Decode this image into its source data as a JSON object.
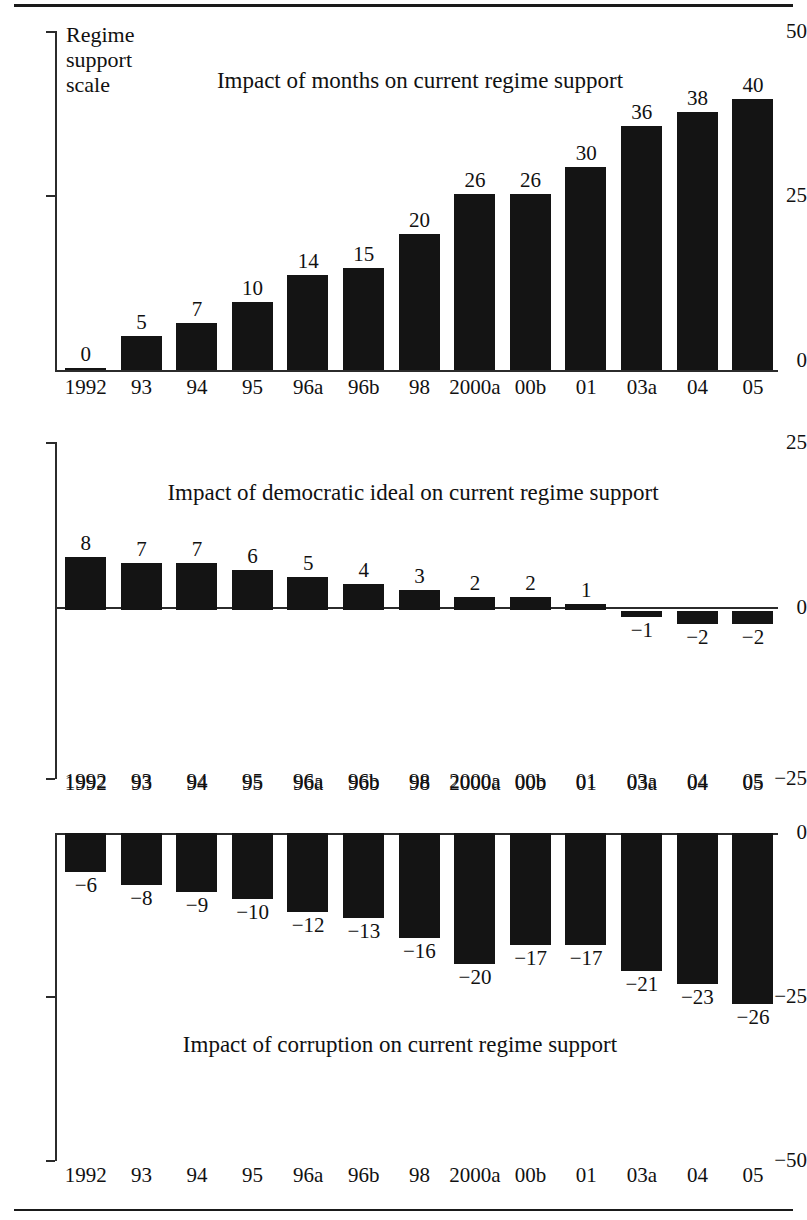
{
  "figure": {
    "background": "#ffffff",
    "bar_color": "#141414",
    "axis_color": "#2b2b2b",
    "rule_color": "#1a1a1a"
  },
  "categories": [
    "1992",
    "93",
    "94",
    "95",
    "96a",
    "96b",
    "98",
    "2000a",
    "00b",
    "01",
    "03a",
    "04",
    "05"
  ],
  "panel1": {
    "title": "Impact of months on current regime support",
    "axis_caption": "Regime support scale",
    "yticks": [
      "50",
      "25",
      "0"
    ]
  },
  "panel2": {
    "title": "Impact of democratic ideal on current regime support",
    "yticks": [
      "25",
      "0",
      "−25"
    ]
  },
  "panel3": {
    "title": "Impact of corruption on current regime support",
    "yticks": [
      "0",
      "−25",
      "−50"
    ]
  },
  "chart_data": [
    {
      "type": "bar",
      "title": "Impact of months on current regime support",
      "xlabel": "",
      "ylabel": "Regime support scale",
      "categories": [
        "1992",
        "93",
        "94",
        "95",
        "96a",
        "96b",
        "98",
        "2000a",
        "00b",
        "01",
        "03a",
        "04",
        "05"
      ],
      "values": [
        0,
        5,
        7,
        10,
        14,
        15,
        20,
        26,
        26,
        30,
        36,
        38,
        40
      ],
      "value_labels": [
        "0",
        "5",
        "7",
        "10",
        "14",
        "15",
        "20",
        "26",
        "26",
        "30",
        "36",
        "38",
        "40"
      ],
      "ylim": [
        0,
        50
      ],
      "yticks": [
        0,
        25,
        50
      ],
      "ytick_labels": [
        "0",
        "25",
        "50"
      ],
      "grid": false,
      "legend": "none"
    },
    {
      "type": "bar",
      "title": "Impact of democratic ideal on current regime support",
      "xlabel": "",
      "ylabel": "",
      "categories": [
        "1992",
        "93",
        "94",
        "95",
        "96a",
        "96b",
        "98",
        "2000a",
        "00b",
        "01",
        "03a",
        "04",
        "05"
      ],
      "values": [
        8,
        7,
        7,
        6,
        5,
        4,
        3,
        2,
        2,
        1,
        -1,
        -2,
        -2
      ],
      "value_labels": [
        "8",
        "7",
        "7",
        "6",
        "5",
        "4",
        "3",
        "2",
        "2",
        "1",
        "−1",
        "−2",
        "−2"
      ],
      "ylim": [
        -25,
        25
      ],
      "yticks": [
        -25,
        0,
        25
      ],
      "ytick_labels": [
        "−25",
        "0",
        "25"
      ],
      "grid": false,
      "legend": "none"
    },
    {
      "type": "bar",
      "title": "Impact of corruption on current regime support",
      "xlabel": "",
      "ylabel": "",
      "categories": [
        "1992",
        "93",
        "94",
        "95",
        "96a",
        "96b",
        "98",
        "2000a",
        "00b",
        "01",
        "03a",
        "04",
        "05"
      ],
      "values": [
        -6,
        -8,
        -9,
        -10,
        -12,
        -13,
        -16,
        -20,
        -17,
        -17,
        -21,
        -23,
        -26
      ],
      "value_labels": [
        "−6",
        "−8",
        "−9",
        "−10",
        "−12",
        "−13",
        "−16",
        "−20",
        "−17",
        "−17",
        "−21",
        "−23",
        "−26"
      ],
      "ylim": [
        -50,
        0
      ],
      "yticks": [
        -50,
        -25,
        0
      ],
      "ytick_labels": [
        "−50",
        "−25",
        "0"
      ],
      "grid": false,
      "legend": "none"
    }
  ]
}
